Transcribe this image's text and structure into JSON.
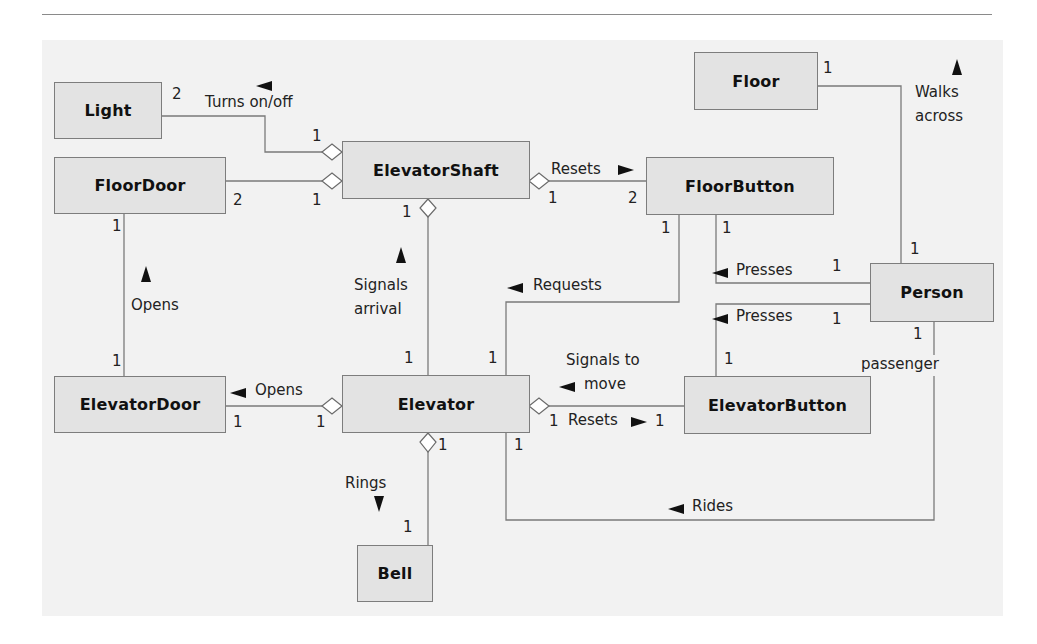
{
  "diagram": {
    "type": "uml-class-diagram",
    "colors": {
      "box_fill": "#e3e3e3",
      "box_border": "#7d7d7d",
      "background": "#f2f2f2",
      "line": "#7a7a7a",
      "text": "#111111"
    },
    "classes": {
      "light": "Light",
      "floor_door": "FloorDoor",
      "elevator_shaft": "ElevatorShaft",
      "floor": "Floor",
      "floor_button": "FloorButton",
      "person": "Person",
      "elevator_door": "ElevatorDoor",
      "elevator": "Elevator",
      "elevator_button": "ElevatorButton",
      "bell": "Bell"
    },
    "associations": {
      "turns_on_off": {
        "label": "Turns on/off",
        "from_mult": "1",
        "to_mult": "2",
        "direction": "left"
      },
      "floor_door_link": {
        "from_mult": "1",
        "to_mult": "2"
      },
      "resets_floor_button": {
        "label": "Resets",
        "from_mult": "1",
        "to_mult": "2",
        "direction": "right"
      },
      "walks_across_line1": "Walks",
      "walks_across_line2": "across",
      "walks_across_floor_mult": "1",
      "walks_across_person_mult": "1",
      "opens_floor_door": {
        "label": "Opens",
        "top_mult": "1",
        "bottom_mult": "1",
        "direction": "up"
      },
      "signals_arrival_line1": "Signals",
      "signals_arrival_line2": "arrival",
      "signals_arrival_shaft_mult": "1",
      "signals_arrival_elevator_mult": "1",
      "requests": {
        "label": "Requests",
        "floor_button_mult": "1",
        "elevator_mult": "1",
        "direction": "left"
      },
      "presses_floor_button": {
        "label": "Presses",
        "floor_button_mult": "1",
        "person_mult": "1",
        "direction": "left"
      },
      "presses_elevator_button": {
        "label": "Presses",
        "elevator_button_mult": "1",
        "person_mult": "1",
        "direction": "left"
      },
      "opens_elevator_door": {
        "label": "Opens",
        "door_mult": "1",
        "elevator_mult": "1",
        "direction": "left"
      },
      "signals_to_move_line1": "Signals to",
      "signals_to_move_line2": "move",
      "resets_elevator_button": {
        "label": "Resets",
        "elevator_mult": "1",
        "button_mult": "1",
        "direction": "right"
      },
      "passenger": {
        "role": "passenger",
        "person_mult": "1"
      },
      "rides": {
        "label": "Rides",
        "elevator_mult": "1",
        "direction": "left"
      },
      "rings": {
        "label": "Rings",
        "elevator_mult": "1",
        "bell_mult": "1",
        "direction": "down"
      }
    }
  }
}
